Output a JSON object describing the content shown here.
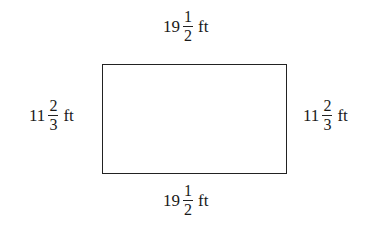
{
  "diagram": {
    "shape": "rectangle",
    "labels": {
      "top": {
        "whole": "19",
        "numerator": "1",
        "denominator": "2",
        "unit": "ft"
      },
      "bottom": {
        "whole": "19",
        "numerator": "1",
        "denominator": "2",
        "unit": "ft"
      },
      "left": {
        "whole": "11",
        "numerator": "2",
        "denominator": "3",
        "unit": "ft"
      },
      "right": {
        "whole": "11",
        "numerator": "2",
        "denominator": "3",
        "unit": "ft"
      }
    },
    "colors": {
      "stroke": "#222222",
      "text": "#1a1a1a",
      "background": "#ffffff"
    }
  }
}
